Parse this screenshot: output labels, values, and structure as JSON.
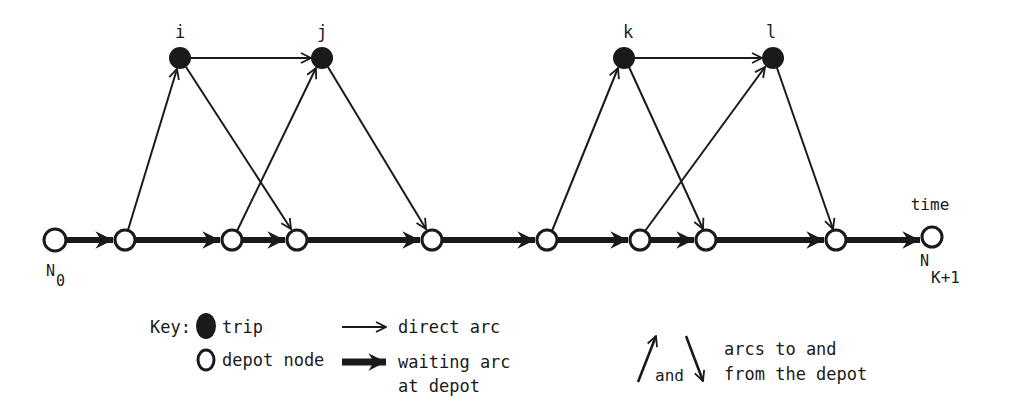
{
  "diagram": {
    "type": "time-space network",
    "time_label": "time",
    "source_label": "N",
    "source_sub": "0",
    "sink_label": "N",
    "sink_sub": "K+1",
    "trip_nodes": [
      {
        "id": "i",
        "label": "i",
        "x": 180,
        "y": 58
      },
      {
        "id": "j",
        "label": "j",
        "x": 322,
        "y": 58
      },
      {
        "id": "k",
        "label": "k",
        "x": 624,
        "y": 58
      },
      {
        "id": "l",
        "label": "l",
        "x": 773,
        "y": 58
      }
    ],
    "depot_nodes": [
      {
        "id": "d0",
        "x": 55
      },
      {
        "id": "d1",
        "x": 125
      },
      {
        "id": "d2",
        "x": 232
      },
      {
        "id": "d3",
        "x": 297
      },
      {
        "id": "d4",
        "x": 432
      },
      {
        "id": "d5",
        "x": 547
      },
      {
        "id": "d6",
        "x": 640
      },
      {
        "id": "d7",
        "x": 706
      },
      {
        "id": "d8",
        "x": 836
      },
      {
        "id": "d9",
        "x": 932
      }
    ],
    "direct_arcs": [
      [
        "i",
        "j"
      ],
      [
        "k",
        "l"
      ]
    ],
    "pull_out_arcs": [
      [
        "d1",
        "i"
      ],
      [
        "d2",
        "j"
      ],
      [
        "d5",
        "k"
      ],
      [
        "d6",
        "l"
      ]
    ],
    "pull_in_arcs": [
      [
        "i",
        "d3"
      ],
      [
        "j",
        "d4"
      ],
      [
        "k",
        "d7"
      ],
      [
        "l",
        "d8"
      ]
    ]
  },
  "legend": {
    "key_label": "Key:",
    "trip": "trip",
    "depot_node": "depot node",
    "direct_arc": "direct arc",
    "waiting_arc_line1": "waiting arc",
    "waiting_arc_line2": "at depot",
    "and": "and",
    "depot_arcs_line1": "arcs to and",
    "depot_arcs_line2": "from the depot"
  }
}
